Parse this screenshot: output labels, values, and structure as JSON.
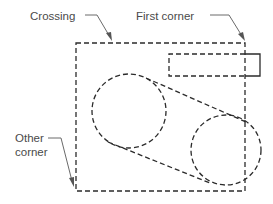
{
  "diagram": {
    "type": "cad-selection-illustration",
    "labels": {
      "crossing": "Crossing",
      "first_corner": "First corner",
      "other_corner_line1": "Other",
      "other_corner_line2": "corner"
    },
    "colors": {
      "line": "#2b2b2b",
      "leader": "#6a6a6a",
      "text": "#4a4a4a",
      "background": "#ffffff"
    },
    "shapes": {
      "crossing_window": {
        "x1": 76,
        "y1": 43,
        "x2": 245,
        "y2": 191,
        "style": "dashed"
      },
      "small_rectangle": {
        "x1": 169,
        "y1": 54,
        "x2": 260,
        "y2": 76,
        "style": "dashed-inside-solid-outside"
      },
      "left_circle": {
        "cx": 129,
        "cy": 111,
        "r": 37,
        "style": "dashed"
      },
      "right_circle": {
        "cx": 226,
        "cy": 150,
        "r": 35,
        "style": "dashed"
      },
      "belt_lines": "two dashed tangent lines connecting the circles"
    }
  }
}
